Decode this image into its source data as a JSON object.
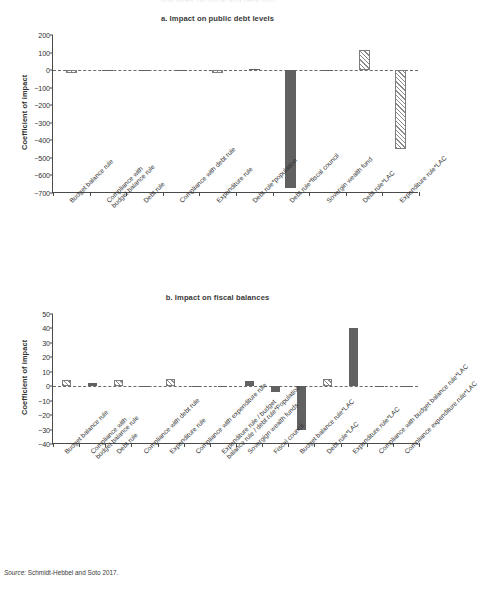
{
  "figure": {
    "cropped_header": "ppy types on fiscal and debt imp",
    "source_prefix": "Source:",
    "source_text": "Schmidt-Hebbel and Soto 2017."
  },
  "chart_data": [
    {
      "type": "bar",
      "panel": "a",
      "title": "a. Impact on public debt levels",
      "xlabel": "",
      "ylabel": "Coefficient of impact",
      "ylim": [
        -700,
        200
      ],
      "yticks": [
        200,
        100,
        0,
        -100,
        -200,
        -300,
        -400,
        -500,
        -600,
        -700
      ],
      "ytick_labels": [
        "200",
        "100",
        "0",
        "−100",
        "−200",
        "−300",
        "−400",
        "−500",
        "−600",
        "−700"
      ],
      "grid": false,
      "legend": "none",
      "categories": [
        "Budget balance rule",
        "Compliance with budget balance rule",
        "Debt rule",
        "Compliance with debt rule",
        "Expenditure rule",
        "Debt rule*population",
        "Debt rule*fiscal council",
        "Sovergin wealth fund",
        "Debt rule*LAC",
        "Expenditure rule*LAC"
      ],
      "category_lines": [
        [
          "Budget balance rule"
        ],
        [
          "Compliance with",
          "budget balance rule"
        ],
        [
          "Debt rule"
        ],
        [
          "Compliance with debt rule"
        ],
        [
          "Expenditure rule"
        ],
        [
          "Debt rule*population"
        ],
        [
          "Debt rule*fiscal council"
        ],
        [
          "Sovergin wealth fund"
        ],
        [
          "Debt rule*LAC"
        ],
        [
          "Expenditure rule*LAC"
        ]
      ],
      "values": [
        -18,
        -7,
        -3,
        -6,
        -15,
        6,
        -672,
        -4,
        115,
        -452
      ],
      "fills": [
        "hatch",
        "solid",
        "solid",
        "solid",
        "hatch",
        "solid",
        "solid",
        "solid",
        "hatch",
        "hatch"
      ]
    },
    {
      "type": "bar",
      "panel": "b",
      "title": "b. Impact on fiscal balances",
      "xlabel": "",
      "ylabel": "Coefficient of impact",
      "ylim": [
        -40,
        50
      ],
      "yticks": [
        50,
        40,
        30,
        20,
        10,
        0,
        -10,
        -20,
        -30,
        -40
      ],
      "ytick_labels": [
        "50",
        "40",
        "30",
        "20",
        "10",
        "0",
        "−10",
        "−20",
        "−30",
        "−40"
      ],
      "grid": false,
      "legend": "none",
      "categories": [
        "Budget balance rule",
        "Compliance with budget balance rule",
        "Debt rule",
        "Compliance with debt rule",
        "Expenditure rule",
        "Compliance with expenditure rule",
        "Expenditure rule / budget balance rule / debt rule*Population",
        "Sovereign wealth funds",
        "Fiscal council",
        "Budget balance rule*LAC",
        "Debt rule*LAC",
        "Expenditure rule*LAC",
        "Compliance with budget balance rule*LAC",
        "Compliance expenditure rule*LAC"
      ],
      "category_lines": [
        [
          "Budget balance rule"
        ],
        [
          "Compliance with",
          "budget balance rule"
        ],
        [
          "Debt rule"
        ],
        [
          "Compliance with debt rule"
        ],
        [
          "Expenditure rule"
        ],
        [
          "Compliance with expenditure rule"
        ],
        [
          "Expenditure rule / budget",
          "balance rule / debt rule*Population"
        ],
        [
          "Sovergign wealth funds"
        ],
        [
          "Fiscal council"
        ],
        [
          "Budget balance rule*LAC"
        ],
        [
          "Debt rule*LAC"
        ],
        [
          "Expenditure rule*LAC"
        ],
        [
          "Compliance with budget balance rule*LAC"
        ],
        [
          "Compliance expenditure rule*LAC"
        ]
      ],
      "values": [
        4,
        2,
        4,
        -0.6,
        5,
        -0.4,
        -0.3,
        3.5,
        -4,
        -30.5,
        5,
        40,
        -0.3,
        -0.3
      ],
      "fills": [
        "hatch",
        "solid",
        "hatch",
        "solid",
        "hatch",
        "solid",
        "solid",
        "solid",
        "solid",
        "solid",
        "hatch",
        "solid",
        "solid",
        "solid"
      ]
    }
  ],
  "colors": {
    "solid_bar": "#616161",
    "hatch_line": "#8a8a8a",
    "axis": "#4a4a4a",
    "text": "#2f2f2f"
  }
}
